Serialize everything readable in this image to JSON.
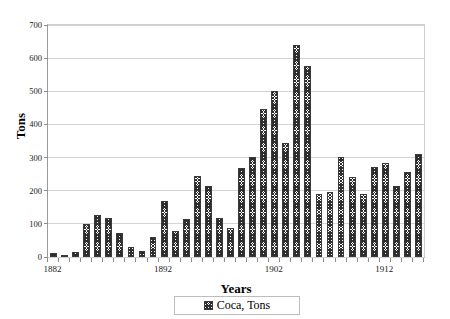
{
  "chart_data": {
    "type": "bar",
    "title": "",
    "xlabel": "Years",
    "ylabel": "Tons",
    "ylim": [
      0,
      700
    ],
    "ytick_step": 100,
    "yticks": [
      0,
      100,
      200,
      300,
      400,
      500,
      600,
      700
    ],
    "xticks_labeled": [
      1882,
      1892,
      1902,
      1912
    ],
    "grid": true,
    "legend_position": "bottom-center",
    "series": [
      {
        "name": "Coca, Tons",
        "categories": [
          1882,
          1883,
          1884,
          1885,
          1886,
          1887,
          1888,
          1889,
          1890,
          1891,
          1892,
          1893,
          1894,
          1895,
          1896,
          1897,
          1898,
          1899,
          1900,
          1901,
          1902,
          1903,
          1904,
          1905,
          1906,
          1907,
          1908,
          1909,
          1910,
          1911,
          1912,
          1913,
          1914,
          1915
        ],
        "values": [
          12,
          2,
          14,
          100,
          128,
          118,
          73,
          31,
          18,
          60,
          168,
          78,
          115,
          243,
          215,
          118,
          88,
          270,
          303,
          447,
          500,
          343,
          640,
          575,
          190,
          196,
          302,
          242,
          190,
          272,
          283,
          213,
          256,
          310
        ]
      }
    ]
  },
  "legend": {
    "label": "Coca, Tons",
    "swatch_name": "hatched-swatch"
  },
  "axes": {
    "y_title": "Tons",
    "x_title": "Years",
    "ytick_labels": [
      "0",
      "100",
      "200",
      "300",
      "400",
      "500",
      "600",
      "700"
    ],
    "xtick_labels": [
      "1882",
      "1892",
      "1902",
      "1912"
    ]
  },
  "colors": {
    "bar_fill": "#ffffff",
    "bar_hatch": "#2e2e2e",
    "bar_border": "#3a3a3a",
    "gridline": "#d4d4d4",
    "axis": "#9a9a9a",
    "text": "#000000",
    "background": "#ffffff"
  }
}
